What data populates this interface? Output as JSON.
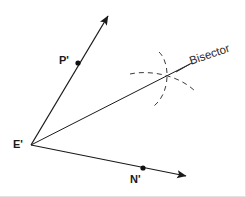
{
  "figure": {
    "kind": "geometry-construction-diagram",
    "width": 246,
    "height": 197,
    "background_color": "#ffffff",
    "stroke_color": "#1a1a1a",
    "dashed_stroke_color": "#3a3a3a"
  },
  "labels": {
    "vertex": "E'",
    "ray_upper_point": "P'",
    "ray_lower_point": "N'",
    "bisector": "Bisector"
  },
  "points": {
    "vertex": {
      "name": "E'",
      "x": 31,
      "y": 145,
      "label_x": 13,
      "label_y": 140
    },
    "p_prime": {
      "name": "P'",
      "x": 78,
      "y": 63,
      "label_x": 60,
      "label_y": 56
    },
    "n_prime": {
      "name": "N'",
      "x": 143,
      "y": 168,
      "label_x": 131,
      "label_y": 175
    },
    "arc_intersection": {
      "name": "bisector-crossing",
      "x": 163,
      "y": 81
    }
  },
  "rays": {
    "ep": {
      "name": "ray-E-to-P",
      "x1": 31,
      "y1": 145,
      "x2": 110,
      "y2": 13,
      "arrow": true
    },
    "en": {
      "name": "ray-E-to-N",
      "x1": 31,
      "y1": 145,
      "x2": 190,
      "y2": 178,
      "arrow": true
    },
    "bisector": {
      "name": "ray-bisector",
      "x1": 31,
      "y1": 145,
      "x2": 192,
      "y2": 63,
      "arrow": false
    }
  },
  "arcs": {
    "arc_from_p_side": {
      "name": "construction-arc-vertical",
      "path": "M 159 52 C 170 62 171 92 154 106",
      "dash": "5,4"
    },
    "arc_from_n_side": {
      "name": "construction-arc-horizontal",
      "path": "M 130 74 C 148 70 178 74 196 92",
      "dash": "5,4"
    }
  },
  "leader": {
    "name": "bisector-leader-line",
    "x1": 176,
    "y1": 72,
    "x2": 192,
    "y2": 63
  },
  "bisector_label_position": {
    "x": 189,
    "y": 61
  }
}
